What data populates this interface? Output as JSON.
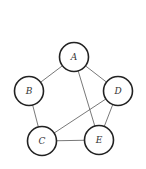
{
  "diagram": {
    "type": "undirected-graph",
    "nodes": [
      {
        "id": "A",
        "label": "A",
        "x": 74,
        "y": 57
      },
      {
        "id": "B",
        "label": "B",
        "x": 29,
        "y": 91
      },
      {
        "id": "C",
        "label": "C",
        "x": 42,
        "y": 141
      },
      {
        "id": "D",
        "label": "D",
        "x": 118,
        "y": 91
      },
      {
        "id": "E",
        "label": "E",
        "x": 99,
        "y": 140
      }
    ],
    "edges": [
      {
        "from": "A",
        "to": "B"
      },
      {
        "from": "A",
        "to": "D"
      },
      {
        "from": "A",
        "to": "E"
      },
      {
        "from": "B",
        "to": "C"
      },
      {
        "from": "C",
        "to": "D"
      },
      {
        "from": "C",
        "to": "E"
      },
      {
        "from": "D",
        "to": "E"
      }
    ],
    "node_radius": 14.5,
    "colors": {
      "edge": "#555555",
      "node_stroke": "#222222",
      "label": "#333333",
      "background": "#ffffff"
    }
  }
}
